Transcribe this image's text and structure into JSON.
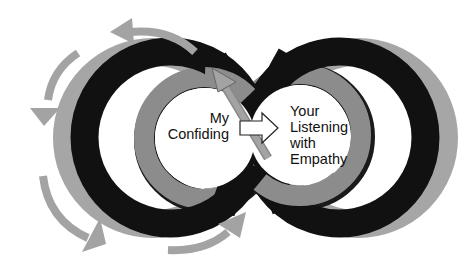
{
  "diagram": {
    "type": "infinity-loop-cycle",
    "left_loop": {
      "label_lines": [
        "My",
        "Confiding"
      ]
    },
    "right_loop": {
      "label_lines": [
        "Your",
        "Listening",
        "with",
        "Empathy"
      ]
    },
    "connector": {
      "from": "left_loop",
      "to": "right_loop",
      "icon": "white-right-arrow"
    },
    "cycle_arrows": [
      {
        "position": "top-left",
        "direction": "counter-clockwise",
        "icon": "curved-arrow"
      },
      {
        "position": "left",
        "direction": "counter-clockwise",
        "icon": "curved-arrow"
      },
      {
        "position": "bottom-left",
        "direction": "counter-clockwise",
        "icon": "curved-arrow"
      },
      {
        "position": "bottom-center",
        "direction": "up-right",
        "icon": "curved-arrow"
      },
      {
        "position": "crossing",
        "direction": "up-left",
        "icon": "straight-arrow"
      }
    ],
    "colors": {
      "background": "#ffffff",
      "outer_ring": "#111111",
      "inner_ring": "#8c8c8c",
      "ring_shadow": "#a6a6a6",
      "cycle_arrow": "#a3a3a3",
      "connector_arrow_fill": "#ffffff",
      "text": "#111111"
    }
  }
}
